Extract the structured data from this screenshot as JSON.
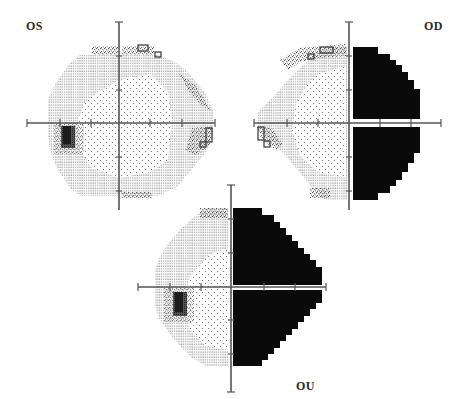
{
  "figure": {
    "type": "visual-field-greyscale-plots",
    "panels": [
      {
        "id": "os",
        "label": "OS",
        "eye": "left",
        "label_pos": {
          "x": 26,
          "y": 19
        },
        "origin": {
          "x": 119,
          "y": 123
        },
        "h_axis": [
          27,
          215
        ],
        "v_axis": [
          22,
          210
        ],
        "ticks_x": [
          60,
          91,
          150,
          182
        ],
        "ticks_y": [
          56,
          90,
          157,
          191
        ],
        "defect": "none",
        "blind_spot": {
          "x": 61,
          "y": 126,
          "w": 14,
          "h": 22,
          "side": "temporal-left"
        }
      },
      {
        "id": "od",
        "label": "OD",
        "eye": "right",
        "label_pos": {
          "x": 424,
          "y": 19
        },
        "origin": {
          "x": 349,
          "y": 123
        },
        "h_axis": [
          254,
          441
        ],
        "v_axis": [
          22,
          210
        ],
        "ticks_x": [
          287,
          318,
          380,
          411
        ],
        "ticks_y": [
          56,
          90,
          157,
          191
        ],
        "defect": "complete right hemianopia (black right half)",
        "blind_spot": null
      },
      {
        "id": "ou",
        "label": "OU",
        "eye": "binocular",
        "label_pos": {
          "x": 296,
          "y": 379
        },
        "origin": {
          "x": 231,
          "y": 287
        },
        "h_axis": [
          138,
          326
        ],
        "v_axis": [
          185,
          392
        ],
        "ticks_x": [
          170,
          201,
          264,
          295
        ],
        "ticks_y": [
          219,
          253,
          320,
          354
        ],
        "defect": "right homonymous hemianopia (black right half)",
        "blind_spot": {
          "x": 173,
          "y": 292,
          "w": 14,
          "h": 24,
          "side": "left"
        }
      }
    ],
    "colors": {
      "axis": "#555555",
      "defect": "#0a0a0a",
      "dot": "#5a5a5a",
      "label": "#2a2a2a",
      "background": "#ffffff"
    }
  }
}
